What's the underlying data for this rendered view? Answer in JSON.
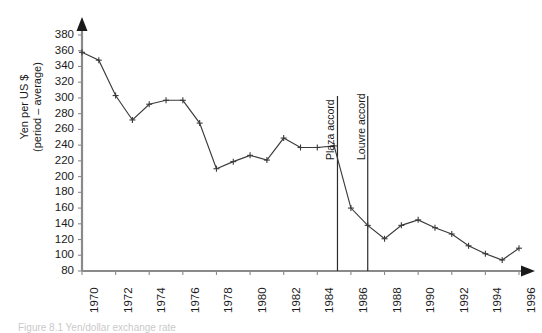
{
  "chart_data": {
    "type": "line",
    "title": "",
    "xlabel": "",
    "ylabel": "Yen per US $ (period – average)",
    "ylabel_line1": "Yen per US $",
    "ylabel_line2": "(period – average)",
    "xlim": [
      1970,
      1996
    ],
    "ylim": [
      80,
      380
    ],
    "ytick_step": 20,
    "grid": false,
    "legend": "none",
    "marker": "plus",
    "line_color": "#3a3a3a",
    "axis_color": "#7a7a7a",
    "annotation_line_color": "#2b2b2b",
    "yticks": [
      80,
      100,
      120,
      140,
      160,
      180,
      200,
      220,
      240,
      260,
      280,
      300,
      320,
      340,
      360,
      380
    ],
    "xticks": [
      1970,
      1972,
      1974,
      1976,
      1978,
      1980,
      1982,
      1984,
      1986,
      1988,
      1990,
      1992,
      1994,
      1996
    ],
    "x": [
      1970,
      1971,
      1972,
      1973,
      1974,
      1975,
      1976,
      1977,
      1978,
      1979,
      1980,
      1981,
      1982,
      1983,
      1984,
      1985,
      1986,
      1987,
      1988,
      1989,
      1990,
      1991,
      1992,
      1993,
      1994,
      1995,
      1996
    ],
    "values": [
      358,
      348,
      303,
      272,
      292,
      297,
      297,
      268,
      210,
      219,
      227,
      221,
      249,
      237,
      237,
      239,
      160,
      138,
      121,
      138,
      145,
      135,
      127,
      112,
      102,
      94,
      109
    ],
    "series": [
      {
        "name": "Yen per US $ (period – average)",
        "values": [
          358,
          348,
          303,
          272,
          292,
          297,
          297,
          268,
          210,
          219,
          227,
          221,
          249,
          237,
          237,
          239,
          160,
          138,
          121,
          138,
          145,
          135,
          127,
          112,
          102,
          94,
          109
        ]
      }
    ],
    "annotations": [
      {
        "label": "Plaza accord",
        "x": 1985.2,
        "type": "vertical-line"
      },
      {
        "label": "Louvre accord",
        "x": 1987.0,
        "type": "vertical-line"
      }
    ]
  },
  "caption": {
    "text": "Figure 8.1  Yen/dollar exchange rate"
  }
}
